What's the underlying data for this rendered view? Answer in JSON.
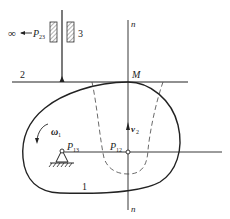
{
  "diagram": {
    "type": "cam-follower mechanism with instant centers",
    "labels": {
      "infinity": "∞",
      "p23_main": "P",
      "p23_sub": "23",
      "link3": "3",
      "link2": "2",
      "point_m": "M",
      "normal_top": "n",
      "normal_bottom": "n",
      "omega_main": "ω",
      "omega_sub": "1",
      "p13_main": "P",
      "p13_sub": "13",
      "p12_main": "P",
      "p12_sub": "12",
      "v2_main": "v",
      "v2_sub": "2",
      "link1": "1"
    },
    "colors": {
      "line": "#222222",
      "background": "#ffffff"
    }
  }
}
